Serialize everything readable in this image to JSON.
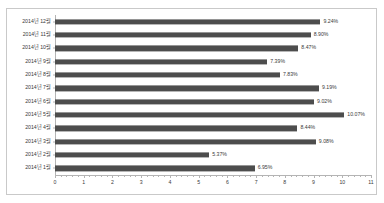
{
  "chart_data": {
    "type": "bar",
    "orientation": "horizontal",
    "title": "",
    "subtitle": "",
    "xlabel": "",
    "ylabel": "",
    "xlim": [
      0,
      11
    ],
    "grid": false,
    "legend": null,
    "bar_color": "#4d4d4d",
    "axis_color": "#b4b4b4",
    "border_color": "#c9c9c9",
    "text_color": "#3a3a3a",
    "xticks": [
      0,
      1,
      2,
      3,
      4,
      5,
      6,
      7,
      8,
      9,
      10,
      11
    ],
    "xtick_labels": [
      "0",
      "1",
      "2",
      "3",
      "4",
      "5",
      "6",
      "7",
      "8",
      "9",
      "10",
      "11"
    ],
    "minor_ticks_per_interval": 4,
    "categories": [
      "2014년 12월",
      "2014년 11월",
      "2014년 10월",
      "2014년 9월",
      "2014년 8월",
      "2014년 7월",
      "2014년 6월",
      "2014년 5월",
      "2014년 4월",
      "2014년 3월",
      "2014년 2월",
      "2014년 1월"
    ],
    "values": [
      9.24,
      8.9,
      8.47,
      7.39,
      7.83,
      9.19,
      9.02,
      10.07,
      8.44,
      9.08,
      5.37,
      6.95
    ],
    "value_labels": [
      "9.24%",
      "8.90%",
      "8.47%",
      "7.39%",
      "7.83%",
      "9.19%",
      "9.02%",
      "10.07%",
      "8.44%",
      "9.08%",
      "5.37%",
      "6.95%"
    ]
  }
}
